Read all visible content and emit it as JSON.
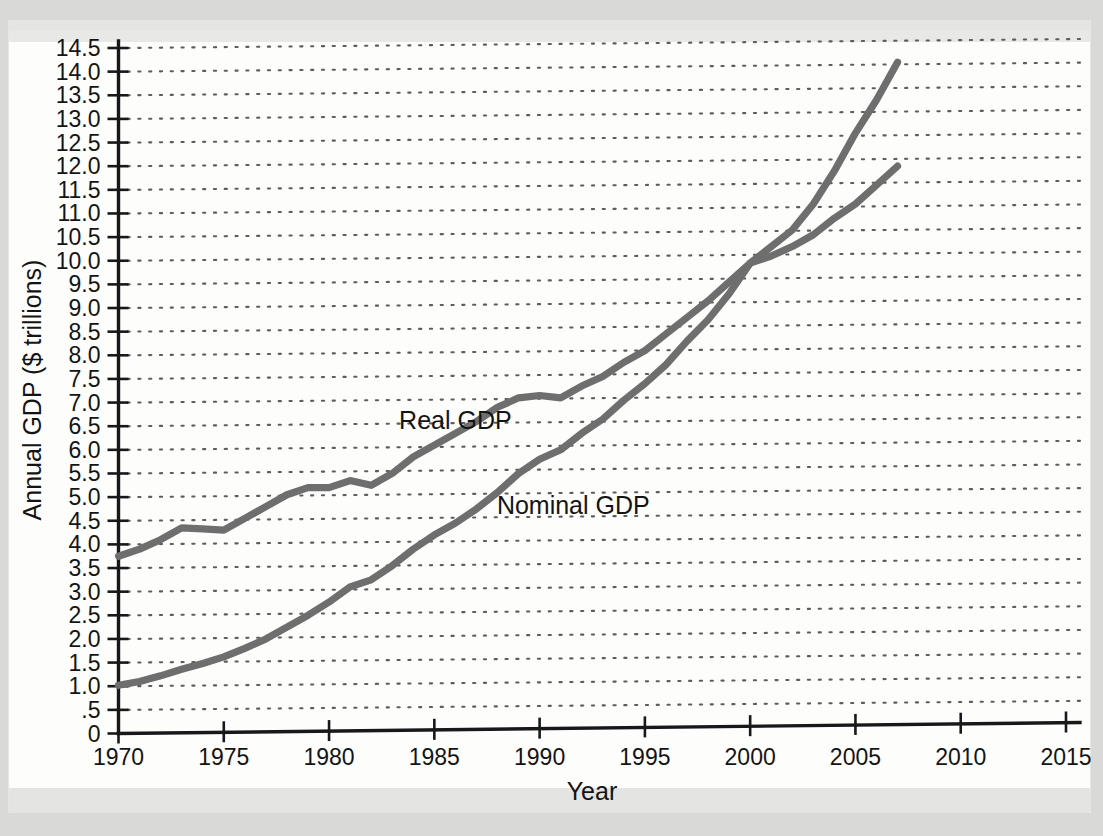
{
  "chart_data": {
    "type": "line",
    "title": "",
    "xlabel": "Year",
    "ylabel": "Annual GDP ($ trillions)",
    "xlim": [
      1970,
      2015
    ],
    "ylim": [
      0,
      14.5
    ],
    "xticks": [
      1970,
      1975,
      1980,
      1985,
      1990,
      1995,
      2000,
      2005,
      2010,
      2015
    ],
    "xtick_labels": [
      "1970",
      "1975",
      "1980",
      "1985",
      "1990",
      "1995",
      "2000",
      "2005",
      "2010",
      "2015"
    ],
    "yticks": [
      0,
      0.5,
      1.0,
      1.5,
      2.0,
      2.5,
      3.0,
      3.5,
      4.0,
      4.5,
      5.0,
      5.5,
      6.0,
      6.5,
      7.0,
      7.5,
      8.0,
      8.5,
      9.0,
      9.5,
      10.0,
      10.5,
      11.0,
      11.5,
      12.0,
      12.5,
      13.0,
      13.5,
      14.0,
      14.5
    ],
    "ytick_labels": [
      "0",
      ".5",
      "1.0",
      "1.5",
      "2.0",
      "2.5",
      "3.0",
      "3.5",
      "4.0",
      "4.5",
      "5.0",
      "5.5",
      "6.0",
      "6.5",
      "7.0",
      "7.5",
      "8.0",
      "8.5",
      "9.0",
      "9.5",
      "10.0",
      "10.5",
      "11.0",
      "11.5",
      "12.0",
      "12.5",
      "13.0",
      "13.5",
      "14.0",
      "14.5"
    ],
    "grid": "horizontal-dotted",
    "legend": "inline-annotations",
    "line_color": "#6e6e6e",
    "axis_color": "#17181a",
    "grid_color": "#5d5d5d",
    "series": [
      {
        "name": "Real GDP",
        "annotation": "Real GDP",
        "annotation_x": 1986.0,
        "annotation_y": 6.62,
        "x": [
          1970,
          1971,
          1972,
          1973,
          1974,
          1975,
          1976,
          1977,
          1978,
          1979,
          1980,
          1981,
          1982,
          1983,
          1984,
          1985,
          1986,
          1987,
          1988,
          1989,
          1990,
          1991,
          1992,
          1993,
          1994,
          1995,
          1996,
          1997,
          1998,
          1999,
          2000,
          2001,
          2002,
          2003,
          2004,
          2005,
          2006,
          2007
        ],
        "values": [
          3.75,
          3.9,
          4.1,
          4.35,
          4.33,
          4.3,
          4.55,
          4.8,
          5.05,
          5.2,
          5.2,
          5.35,
          5.25,
          5.5,
          5.85,
          6.1,
          6.35,
          6.6,
          6.9,
          7.1,
          7.15,
          7.1,
          7.35,
          7.55,
          7.85,
          8.1,
          8.45,
          8.8,
          9.15,
          9.55,
          9.95,
          10.1,
          10.3,
          10.55,
          10.9,
          11.2,
          11.6,
          12.0
        ]
      },
      {
        "name": "Nominal GDP",
        "annotation": "Nominal GDP",
        "annotation_x": 1991.6,
        "annotation_y": 4.82,
        "x": [
          1970,
          1971,
          1972,
          1973,
          1974,
          1975,
          1976,
          1977,
          1978,
          1979,
          1980,
          1981,
          1982,
          1983,
          1984,
          1985,
          1986,
          1987,
          1988,
          1989,
          1990,
          1991,
          1992,
          1993,
          1994,
          1995,
          1996,
          1997,
          1998,
          1999,
          2000,
          2001,
          2002,
          2003,
          2004,
          2005,
          2006,
          2007
        ],
        "values": [
          1.02,
          1.1,
          1.22,
          1.36,
          1.48,
          1.62,
          1.8,
          2.0,
          2.25,
          2.5,
          2.78,
          3.1,
          3.25,
          3.55,
          3.9,
          4.2,
          4.45,
          4.75,
          5.1,
          5.5,
          5.8,
          6.0,
          6.35,
          6.65,
          7.05,
          7.4,
          7.8,
          8.3,
          8.75,
          9.3,
          9.95,
          10.3,
          10.65,
          11.2,
          11.9,
          12.7,
          13.4,
          14.2
        ]
      }
    ]
  }
}
